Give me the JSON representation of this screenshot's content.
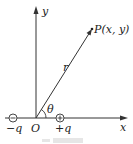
{
  "diagram": {
    "type": "coordinate-diagram",
    "axes": {
      "x_label": "x",
      "y_label": "y",
      "origin_label": "O"
    },
    "point": {
      "label": "P(x, y)"
    },
    "vector": {
      "label": "r"
    },
    "angle": {
      "label": "θ"
    },
    "charges": [
      {
        "label": "−q",
        "symbol": "−"
      },
      {
        "label": "+q",
        "symbol": "+"
      }
    ],
    "colors": {
      "line": "#333333",
      "text": "#222222"
    }
  }
}
